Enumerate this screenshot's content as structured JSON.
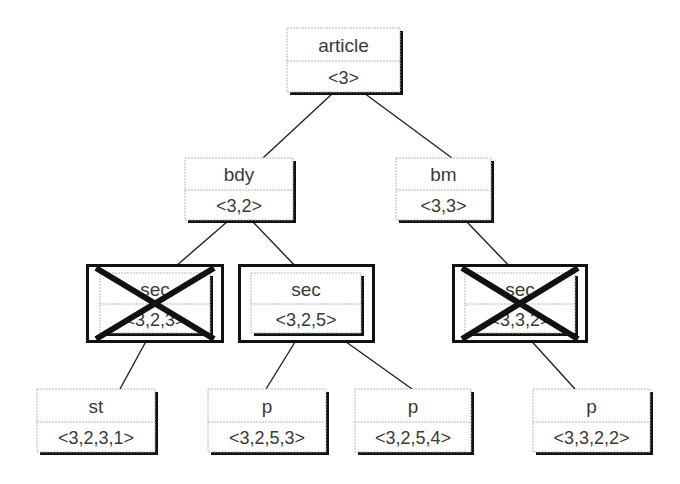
{
  "diagram": {
    "type": "tree",
    "colors": {
      "background": "#ffffff",
      "box_border": "#b8b8b8",
      "box_shadow": "#111111",
      "edge": "#222222",
      "text": "#3a3a3a",
      "cross": "#111111"
    },
    "nodes": [
      {
        "id": "article",
        "label": "article",
        "code": "<3>",
        "x": 287,
        "y": 28,
        "w": 113,
        "h": 64,
        "frame": false,
        "crossed": false
      },
      {
        "id": "bdy",
        "label": "bdy",
        "code": "<3,2>",
        "x": 185,
        "y": 158,
        "w": 108,
        "h": 62,
        "frame": false,
        "crossed": false
      },
      {
        "id": "bm",
        "label": "bm",
        "code": "<3,3>",
        "x": 396,
        "y": 158,
        "w": 95,
        "h": 62,
        "frame": false,
        "crossed": false
      },
      {
        "id": "sec1",
        "label": "sec",
        "code": "<3,2,3>",
        "x": 100,
        "y": 273,
        "w": 110,
        "h": 60,
        "frame": true,
        "crossed": true
      },
      {
        "id": "sec2",
        "label": "sec",
        "code": "<3,2,5>",
        "x": 251,
        "y": 273,
        "w": 110,
        "h": 60,
        "frame": true,
        "crossed": false
      },
      {
        "id": "sec3",
        "label": "sec",
        "code": "<3,3,2>",
        "x": 465,
        "y": 273,
        "w": 110,
        "h": 60,
        "frame": true,
        "crossed": true
      },
      {
        "id": "st",
        "label": "st",
        "code": "<3,2,3,1>",
        "x": 37,
        "y": 389,
        "w": 118,
        "h": 63,
        "frame": false,
        "crossed": false
      },
      {
        "id": "p1",
        "label": "p",
        "code": "<3,2,5,3>",
        "x": 208,
        "y": 389,
        "w": 118,
        "h": 63,
        "frame": false,
        "crossed": false
      },
      {
        "id": "p2",
        "label": "p",
        "code": "<3,2,5,4>",
        "x": 355,
        "y": 389,
        "w": 116,
        "h": 63,
        "frame": false,
        "crossed": false
      },
      {
        "id": "p3",
        "label": "p",
        "code": "<3,3,2,2>",
        "x": 533,
        "y": 389,
        "w": 117,
        "h": 63,
        "frame": false,
        "crossed": false
      }
    ],
    "edges": [
      {
        "from": "article",
        "to": "bdy"
      },
      {
        "from": "article",
        "to": "bm"
      },
      {
        "from": "bdy",
        "to": "sec1"
      },
      {
        "from": "bdy",
        "to": "sec2"
      },
      {
        "from": "bm",
        "to": "sec3"
      },
      {
        "from": "sec1",
        "to": "st"
      },
      {
        "from": "sec2",
        "to": "p1"
      },
      {
        "from": "sec2",
        "to": "p2"
      },
      {
        "from": "sec3",
        "to": "p3"
      }
    ],
    "edge_points": [
      {
        "x1": 333,
        "y1": 93,
        "x2": 263,
        "y2": 158
      },
      {
        "x1": 364,
        "y1": 93,
        "x2": 452,
        "y2": 158
      },
      {
        "x1": 228,
        "y1": 221,
        "x2": 168,
        "y2": 273
      },
      {
        "x1": 252,
        "y1": 221,
        "x2": 302,
        "y2": 273
      },
      {
        "x1": 466,
        "y1": 221,
        "x2": 516,
        "y2": 273
      },
      {
        "x1": 150,
        "y1": 334,
        "x2": 120,
        "y2": 389
      },
      {
        "x1": 300,
        "y1": 334,
        "x2": 266,
        "y2": 389
      },
      {
        "x1": 335,
        "y1": 334,
        "x2": 412,
        "y2": 389
      },
      {
        "x1": 525,
        "y1": 334,
        "x2": 575,
        "y2": 389
      }
    ],
    "frames": [
      {
        "node": "sec1",
        "x": 86,
        "y": 264,
        "w": 138,
        "h": 79
      },
      {
        "node": "sec2",
        "x": 238,
        "y": 264,
        "w": 137,
        "h": 79
      },
      {
        "node": "sec3",
        "x": 452,
        "y": 264,
        "w": 136,
        "h": 79
      }
    ]
  }
}
